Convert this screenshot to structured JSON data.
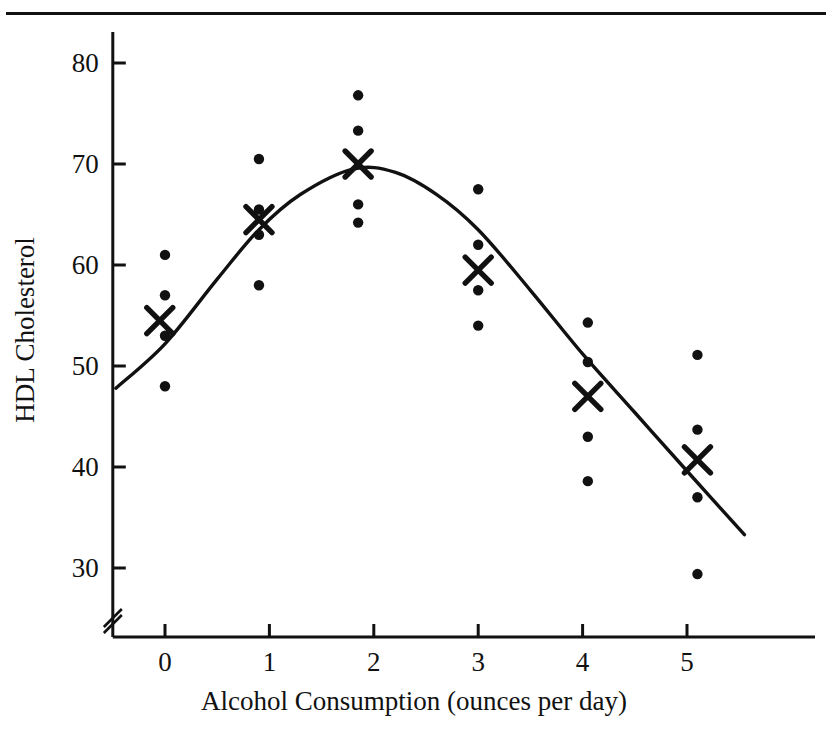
{
  "chart_data": {
    "type": "scatter",
    "title": "",
    "xlabel": "Alcohol Consumption (ounces per day)",
    "ylabel": "HDL Cholesterol",
    "xlim": [
      -0.5,
      5.6
    ],
    "ylim": [
      25.8,
      82.9
    ],
    "grid": false,
    "legend": null,
    "axis_break": {
      "axis": "y",
      "symbol": "//",
      "note": "y-axis broken below 30"
    },
    "xticks": [
      0,
      1,
      2,
      3,
      4,
      5
    ],
    "xtick_labels": [
      "0",
      "1",
      "2",
      "3",
      "4",
      "5"
    ],
    "yticks": [
      30,
      40,
      50,
      60,
      70,
      80
    ],
    "ytick_labels": [
      "30",
      "40",
      "50",
      "60",
      "70",
      "80"
    ],
    "groups": [
      {
        "x": 0.0,
        "label": "0",
        "points": [
          61.0,
          57.0,
          53.0,
          48.0
        ],
        "mean_marker": {
          "x": -0.05,
          "y": 54.5,
          "symbol": "X"
        }
      },
      {
        "x": 0.9,
        "label": "1",
        "points": [
          70.5,
          65.5,
          63.0,
          58.0
        ],
        "mean_marker": {
          "x": 0.9,
          "y": 64.5,
          "symbol": "X"
        }
      },
      {
        "x": 1.85,
        "label": "2",
        "points": [
          76.8,
          73.3,
          66.0,
          64.2
        ],
        "mean_marker": {
          "x": 1.85,
          "y": 70.0,
          "symbol": "X"
        }
      },
      {
        "x": 3.0,
        "label": "3",
        "points": [
          67.5,
          62.0,
          57.5,
          54.0
        ],
        "mean_marker": {
          "x": 3.0,
          "y": 59.5,
          "symbol": "X"
        }
      },
      {
        "x": 4.05,
        "label": "4",
        "points": [
          54.3,
          50.4,
          43.0,
          38.6
        ],
        "mean_marker": {
          "x": 4.05,
          "y": 47.0,
          "symbol": "X"
        }
      },
      {
        "x": 5.1,
        "label": "5",
        "points": [
          51.1,
          43.7,
          37.0,
          29.4
        ],
        "mean_marker": {
          "x": 5.1,
          "y": 40.7,
          "symbol": "X"
        }
      }
    ],
    "fit_curve": {
      "kind": "quadratic",
      "description": "smooth concave curve peaking near x=1.8",
      "points": [
        {
          "x": -0.47,
          "y": 47.8
        },
        {
          "x": 0.0,
          "y": 52.2
        },
        {
          "x": 0.5,
          "y": 58.6
        },
        {
          "x": 0.9,
          "y": 63.5
        },
        {
          "x": 1.3,
          "y": 67.0
        },
        {
          "x": 1.8,
          "y": 69.5
        },
        {
          "x": 2.2,
          "y": 69.2
        },
        {
          "x": 2.6,
          "y": 67.0
        },
        {
          "x": 3.0,
          "y": 63.5
        },
        {
          "x": 3.5,
          "y": 57.5
        },
        {
          "x": 4.0,
          "y": 51.2
        },
        {
          "x": 4.5,
          "y": 45.4
        },
        {
          "x": 5.0,
          "y": 39.6
        },
        {
          "x": 5.55,
          "y": 33.3
        }
      ]
    },
    "colors": {
      "ink": "#111111",
      "background": "#ffffff"
    }
  }
}
